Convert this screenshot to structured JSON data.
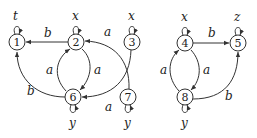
{
  "diagram": {
    "type": "automaton-graph",
    "components": [
      {
        "name": "left-graph",
        "nodes": [
          {
            "id": "1",
            "label": "1",
            "x": 17,
            "y": 42,
            "loop_label": "t"
          },
          {
            "id": "2",
            "label": "2",
            "x": 76,
            "y": 42,
            "loop_label": "x"
          },
          {
            "id": "3",
            "label": "3",
            "x": 132,
            "y": 42,
            "loop_label": "x"
          },
          {
            "id": "6",
            "label": "6",
            "x": 73,
            "y": 97,
            "loop_label": "y"
          },
          {
            "id": "7",
            "label": "7",
            "x": 128,
            "y": 97,
            "loop_label": "y"
          }
        ],
        "edges": [
          {
            "from": "2",
            "to": "1",
            "label": "b"
          },
          {
            "from": "6",
            "to": "1",
            "label": "b"
          },
          {
            "from": "2",
            "to": "6",
            "label": "a"
          },
          {
            "from": "6",
            "to": "2",
            "label": "a"
          },
          {
            "from": "3",
            "to": "6",
            "label": "a"
          },
          {
            "from": "7",
            "to": "2",
            "label": "a"
          }
        ]
      },
      {
        "name": "right-graph",
        "nodes": [
          {
            "id": "4",
            "label": "4",
            "x": 185,
            "y": 43,
            "loop_label": "x"
          },
          {
            "id": "5",
            "label": "5",
            "x": 238,
            "y": 43,
            "loop_label": "z"
          },
          {
            "id": "8",
            "label": "8",
            "x": 185,
            "y": 97,
            "loop_label": "y"
          }
        ],
        "edges": [
          {
            "from": "4",
            "to": "5",
            "label": "b"
          },
          {
            "from": "8",
            "to": "5",
            "label": "b"
          },
          {
            "from": "4",
            "to": "8",
            "label": "a"
          },
          {
            "from": "8",
            "to": "4",
            "label": "a"
          }
        ]
      }
    ],
    "text": {
      "n1": "1",
      "n2": "2",
      "n3": "3",
      "n4": "4",
      "n5": "5",
      "n6": "6",
      "n7": "7",
      "n8": "8",
      "loop1": "t",
      "loop2": "x",
      "loop3": "x",
      "loop4": "x",
      "loop5": "z",
      "loop6": "y",
      "loop7": "y",
      "loop8": "y",
      "e21": "b",
      "e61": "b",
      "e26": "a",
      "e62": "a",
      "e36": "a",
      "e72": "a",
      "e45": "b",
      "e85": "b",
      "e48": "a",
      "e84": "a"
    }
  }
}
